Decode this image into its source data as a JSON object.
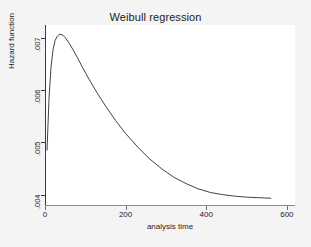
{
  "chart_data": {
    "type": "line",
    "title": "Weibull regression",
    "xlabel": "analysis time",
    "ylabel": "Hazard function",
    "xlim": [
      0,
      620
    ],
    "ylim": [
      0.0038,
      0.00725
    ],
    "grid": false,
    "legend": "none",
    "xticks": [
      0,
      200,
      400,
      600
    ],
    "xtick_labels": [
      "0",
      "200",
      "400",
      "600"
    ],
    "yticks": [
      0.004,
      0.005,
      0.006,
      0.007
    ],
    "ytick_labels": [
      ".004",
      ".005",
      ".006",
      ".007"
    ],
    "series": [
      {
        "name": "Hazard function",
        "color": "#2b2b2b",
        "x": [
          5,
          10,
          15,
          20,
          25,
          30,
          35,
          40,
          45,
          50,
          60,
          70,
          80,
          95,
          110,
          130,
          150,
          175,
          200,
          230,
          260,
          290,
          320,
          350,
          380,
          410,
          440,
          470,
          500,
          530,
          560
        ],
        "y": [
          0.00485,
          0.00585,
          0.00645,
          0.00678,
          0.00695,
          0.00703,
          0.00707,
          0.00707,
          0.00705,
          0.00701,
          0.0069,
          0.00677,
          0.00663,
          0.00641,
          0.0062,
          0.00594,
          0.0057,
          0.00542,
          0.00517,
          0.00491,
          0.00468,
          0.00449,
          0.00433,
          0.00421,
          0.00411,
          0.00404,
          0.004,
          0.00397,
          0.00395,
          0.00394,
          0.00393
        ]
      }
    ],
    "peak": {
      "x": 42,
      "y": 0.00707
    },
    "start": {
      "x": 5,
      "y": 0.00485
    },
    "end": {
      "x": 560,
      "y": 0.00393
    }
  },
  "colors": {
    "page_background": "#f3f3f3",
    "plot_background": "#ffffff",
    "axis": "#3c3c3c",
    "curve": "#2b2b2b",
    "text": "#1c1c1c"
  }
}
